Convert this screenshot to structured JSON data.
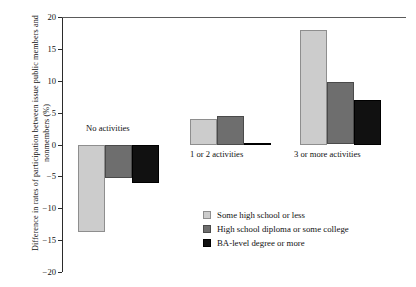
{
  "chart_data": {
    "type": "bar",
    "title": "",
    "subtitle": "",
    "xlabel": "",
    "ylabel": "Difference in rates of participation between issue public members and nonmembers (%)",
    "ylim": [
      -20,
      20
    ],
    "yticks": [
      "20",
      "15",
      "10",
      "5",
      "0",
      "−5",
      "−10",
      "−15",
      "−20"
    ],
    "ytick_values": [
      20,
      15,
      10,
      5,
      0,
      -5,
      -10,
      -15,
      -20
    ],
    "grid": false,
    "legend_position": "inside-bottom-right",
    "categories": [
      "No activities",
      "1 or 2 activities",
      "3 or more activities"
    ],
    "series": [
      {
        "name": "Some high school or less",
        "color": "#cccccc",
        "values": [
          -13.7,
          4.0,
          18.0
        ]
      },
      {
        "name": "High school diploma or some college",
        "color": "#6e6e6e",
        "values": [
          -5.2,
          4.5,
          9.8
        ]
      },
      {
        "name": "BA-level degree or more",
        "color": "#111111",
        "values": [
          -6.0,
          0.3,
          7.0
        ]
      }
    ]
  },
  "axis": {
    "zero_label": "0"
  },
  "group_labels": {
    "no_activities": "No activities",
    "one_or_two": "1 or 2 activities",
    "three_or_more": "3 or more activities"
  },
  "legend": {
    "items": [
      {
        "label": "Some high school or less",
        "swatch": "light-gray-swatch"
      },
      {
        "label": "High school diploma or some college",
        "swatch": "mid-gray-swatch"
      },
      {
        "label": "BA-level degree or more",
        "swatch": "black-swatch"
      }
    ]
  }
}
